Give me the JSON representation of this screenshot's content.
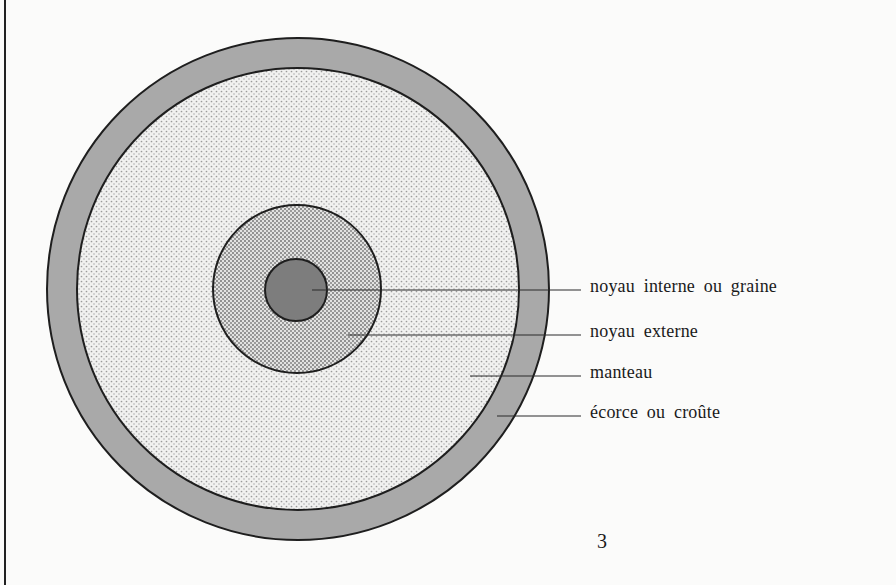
{
  "diagram": {
    "layers": [
      {
        "id": "graine",
        "label": "noyau interne ou graine",
        "fill": "#7d7d7d",
        "pattern": "solid"
      },
      {
        "id": "noyau-externe",
        "label": "noyau externe",
        "fill": "#d4d4d4",
        "pattern": "dense-dots"
      },
      {
        "id": "manteau",
        "label": "manteau",
        "fill": "#e6e6e6",
        "pattern": "light-dots"
      },
      {
        "id": "ecorce",
        "label": "écorce ou croûte",
        "fill": "#a9a9a9",
        "pattern": "solid"
      }
    ],
    "colors": {
      "outline": "#1e1e1e",
      "crust": "#a9a9a9",
      "core": "#7d7d7d",
      "background": "#fbfbfa"
    }
  },
  "labels": {
    "inner_core": "noyau interne ou graine",
    "outer_core": "noyau externe",
    "mantle": "manteau",
    "crust": "écorce ou croûte"
  },
  "page": {
    "number": "3"
  }
}
